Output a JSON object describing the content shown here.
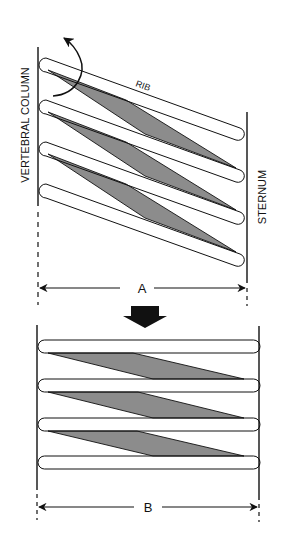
{
  "diagram": {
    "labels": {
      "vertebral_column": "VERTEBRAL COLUMN",
      "sternum": "STERNUM",
      "rib": "RIB",
      "distance_a": "A",
      "distance_b": "B"
    },
    "colors": {
      "line": "#111111",
      "muscle_fill": "#8c8c8c",
      "rib_fill": "#ffffff",
      "background": "#ffffff"
    },
    "panels": [
      {
        "name": "top",
        "state": "ribs slanted (depressed)",
        "rib_count": 4,
        "width_label": "A"
      },
      {
        "name": "bottom",
        "state": "ribs horizontal (elevated)",
        "rib_count": 4,
        "width_label": "B"
      }
    ],
    "icons": [
      "rotation-arrow-icon",
      "down-arrow-icon",
      "double-headed-arrow-icon"
    ]
  }
}
